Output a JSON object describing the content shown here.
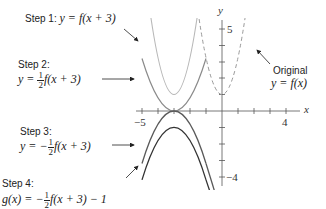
{
  "diagram": {
    "axes": {
      "x_label": "x",
      "y_label": "y",
      "x_tick_labels": {
        "min": "−5",
        "max": "4"
      },
      "y_tick_labels": {
        "max": "5",
        "min": "−4"
      }
    },
    "curves": [
      {
        "name": "original",
        "equation": "y = f(x)",
        "style": "dashed",
        "color": "#9a9a9a"
      },
      {
        "name": "step1",
        "equation": "y = f(x+3)",
        "style": "solid",
        "color": "#b8b8b8"
      },
      {
        "name": "step2",
        "equation": "y = 1/2 f(x+3)",
        "style": "solid",
        "color": "#8a8a8a"
      },
      {
        "name": "step3",
        "equation": "y = -1/2 f(x+3)",
        "style": "solid",
        "color": "#5a5a5a"
      },
      {
        "name": "step4",
        "equation": "g(x) = -1/2 f(x+3) - 1",
        "style": "solid",
        "color": "#333333"
      }
    ],
    "labels": {
      "step1_title": "Step 1:",
      "step1_eq": "y = f(x + 3)",
      "step2_title": "Step 2:",
      "step2_lhs": "y = ",
      "step2_rhs": "f(x + 3)",
      "step3_title": "Step 3:",
      "step3_lhs": "y = −",
      "step3_rhs": "f(x + 3)",
      "step4_title": "Step 4:",
      "step4_lhs": "g(x) = −",
      "step4_rhs": "f(x + 3) − 1",
      "frac_num": "1",
      "frac_den": "2",
      "original_title": "Original",
      "original_eq": "y = f(x)"
    }
  }
}
